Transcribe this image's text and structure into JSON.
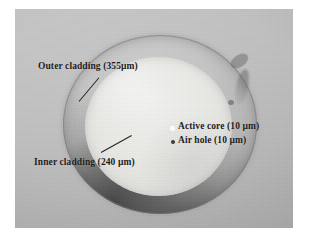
{
  "figure": {
    "kind": "optical-fiber-cross-section-micrograph",
    "plate": {
      "background_color": "#b9b9b9",
      "border_color": "#ffffff"
    }
  },
  "annotations": [
    {
      "id": "outer-cladding",
      "text": "Outer cladding  (355µm)",
      "structure": "Outer cladding",
      "dimension": "355µm",
      "color": "#1c1a18",
      "has_leader_line": true
    },
    {
      "id": "inner-cladding",
      "text": "Inner cladding (240 µm)",
      "structure": "Inner cladding",
      "dimension": "240 µm",
      "color": "#1c1a18",
      "has_leader_line": true
    },
    {
      "id": "active-core",
      "text": "Active core (10 µm)",
      "structure": "Active core",
      "dimension": "10 µm",
      "color": "#1c1a18",
      "marker": "white-dot",
      "marker_color": "#fdfdfd",
      "has_leader_line": false
    },
    {
      "id": "air-hole",
      "text": "Air hole (10 µm)",
      "structure": "Air hole",
      "dimension": "10 µm",
      "color": "#1c1a18",
      "marker": "dark-dot",
      "marker_color": "#3b3b3b",
      "has_leader_line": false
    }
  ],
  "regions": {
    "outer_cladding": {
      "label": "Outer cladding",
      "diameter_label": "355µm",
      "fill_color": "#c6c6c6"
    },
    "inner_cladding": {
      "label": "Inner cladding",
      "diameter_label": "240 µm",
      "fill_color": "#eaeae7"
    },
    "active_core": {
      "label": "Active core",
      "diameter_label": "10 µm",
      "fill_color": "#fdfdfd"
    },
    "air_hole": {
      "label": "Air hole",
      "diameter_label": "10 µm",
      "fill_color": "#3b3b3b"
    }
  }
}
